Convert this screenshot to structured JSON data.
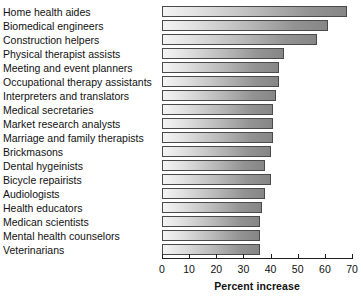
{
  "chart_data": {
    "type": "bar",
    "orientation": "horizontal",
    "title": "",
    "xlabel": "Percent increase",
    "ylabel": "",
    "xlim": [
      0,
      70
    ],
    "xticks": [
      0,
      10,
      20,
      30,
      40,
      50,
      60,
      70
    ],
    "grid": false,
    "legend": null,
    "categories": [
      "Home health aides",
      "Biomedical engineers",
      "Construction helpers",
      "Physical therapist assists",
      "Meeting and event planners",
      "Occupational therapy assistants",
      "Interpreters and translators",
      "Medical secretaries",
      "Market research analysts",
      "Marriage and family therapists",
      "Brickmasons",
      "Dental hygeinists",
      "Bicycle repairists",
      "Audiologists",
      "Health educators",
      "Medican scientists",
      "Mental health counselors",
      "Veterinarians"
    ],
    "values": [
      68,
      61,
      57,
      45,
      43,
      43,
      42,
      41,
      41,
      41,
      40,
      38,
      40,
      38,
      37,
      36,
      36,
      36
    ]
  }
}
